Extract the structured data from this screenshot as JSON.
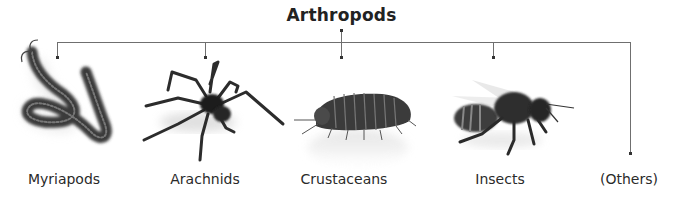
{
  "diagram": {
    "title": "Arthropods",
    "groups": [
      {
        "label": "Myriapods",
        "icon": "centipede-icon"
      },
      {
        "label": "Arachnids",
        "icon": "spider-icon"
      },
      {
        "label": "Crustaceans",
        "icon": "woodlouse-icon"
      },
      {
        "label": "Insects",
        "icon": "bee-icon"
      },
      {
        "label": "(Others)",
        "icon": null
      }
    ],
    "colors": {
      "line": "#6f6f6f",
      "text": "#222222",
      "background": "#ffffff"
    }
  }
}
